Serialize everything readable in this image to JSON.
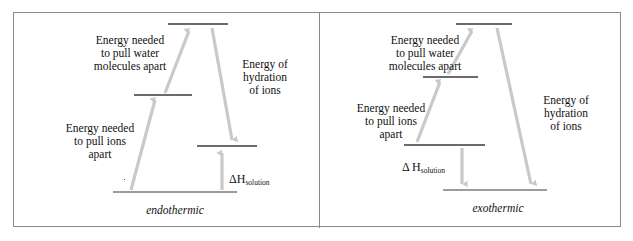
{
  "figure": {
    "border_color": "#8a8a8a",
    "arrow_color": "#c9c9c9",
    "level_color": "#3a3a3a",
    "text_color": "#111111"
  },
  "panels": [
    {
      "id": "endothermic",
      "caption": "endothermic",
      "labels": {
        "water": "Energy needed\nto pull water\nmolecules apart",
        "ions": "Energy needed\nto pull ions\napart",
        "hydration": "Energy of\nhydration\nof ions",
        "delta_h": "ΔH",
        "delta_h_sub": "solution"
      },
      "levels": [
        {
          "name": "top-level",
          "x1": 155,
          "x2": 215,
          "y": 12
        },
        {
          "name": "second-level",
          "x1": 121,
          "x2": 179,
          "y": 83
        },
        {
          "name": "third-level",
          "x1": 184,
          "x2": 244,
          "y": 134
        },
        {
          "name": "baseline-level",
          "x1": 100,
          "x2": 224,
          "y": 180
        }
      ],
      "arrows": [
        {
          "name": "pull-ions-arrow",
          "x1": 118,
          "y1": 178,
          "x2": 142,
          "y2": 86,
          "dir": "up"
        },
        {
          "name": "pull-water-arrow",
          "x1": 152,
          "y1": 81,
          "x2": 176,
          "y2": 16,
          "dir": "up"
        },
        {
          "name": "hydration-arrow",
          "x1": 199,
          "y1": 16,
          "x2": 219,
          "y2": 131,
          "dir": "down"
        },
        {
          "name": "delta-h-arrow",
          "x1": 209,
          "y1": 178,
          "x2": 209,
          "y2": 138,
          "dir": "up"
        }
      ]
    },
    {
      "id": "exothermic",
      "caption": "exothermic",
      "labels": {
        "water": "Energy needed\nto pull water\nmolecules apart",
        "ions": "Energy needed\nto pull ions\napart",
        "hydration": "Energy of\nhydration\nof ions",
        "delta_h": "Δ H",
        "delta_h_sub": "solution"
      },
      "levels": [
        {
          "name": "top-level",
          "x1": 136,
          "x2": 192,
          "y": 12
        },
        {
          "name": "second-level",
          "x1": 103,
          "x2": 158,
          "y": 65
        },
        {
          "name": "third-level",
          "x1": 84,
          "x2": 165,
          "y": 133
        },
        {
          "name": "baseline-level",
          "x1": 123,
          "x2": 227,
          "y": 178
        }
      ],
      "arrows": [
        {
          "name": "pull-ions-arrow",
          "x1": 97,
          "y1": 130,
          "x2": 120,
          "y2": 68,
          "dir": "up"
        },
        {
          "name": "pull-water-arrow",
          "x1": 128,
          "y1": 62,
          "x2": 152,
          "y2": 16,
          "dir": "up"
        },
        {
          "name": "hydration-arrow",
          "x1": 177,
          "y1": 16,
          "x2": 211,
          "y2": 175,
          "dir": "down"
        },
        {
          "name": "delta-h-arrow",
          "x1": 142,
          "y1": 136,
          "x2": 142,
          "y2": 175,
          "dir": "down"
        }
      ]
    }
  ]
}
